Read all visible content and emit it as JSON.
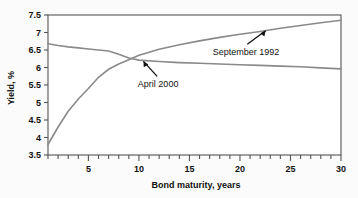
{
  "chart_data": {
    "type": "line",
    "title": "",
    "xlabel": "Bond maturity, years",
    "ylabel": "Yield, %",
    "xlim": [
      1,
      30
    ],
    "ylim": [
      3.5,
      7.5
    ],
    "xticks": [
      5,
      10,
      15,
      20,
      25,
      30
    ],
    "xtick_labels": [
      "5",
      "10",
      "15",
      "20",
      "25",
      "30"
    ],
    "xminor_step": 1,
    "yticks": [
      3.5,
      4,
      4.5,
      5,
      5.5,
      6,
      6.5,
      7,
      7.5
    ],
    "ytick_labels": [
      "3.5",
      "4",
      "4.5",
      "5",
      "5.5",
      "6",
      "6.5",
      "7",
      "7.5"
    ],
    "grid": false,
    "legend": "none",
    "line_color": "#8a8a8a",
    "axis_color": "#555555",
    "background": "#fbfbfb",
    "series": [
      {
        "name": "September 1992",
        "x": [
          1,
          2,
          3,
          4,
          5,
          6,
          7,
          8,
          9,
          10,
          12,
          14,
          16,
          18,
          20,
          22,
          24,
          26,
          28,
          30
        ],
        "values": [
          3.8,
          4.3,
          4.75,
          5.1,
          5.4,
          5.72,
          5.95,
          6.1,
          6.22,
          6.35,
          6.52,
          6.65,
          6.76,
          6.86,
          6.95,
          7.03,
          7.12,
          7.2,
          7.28,
          7.35
        ]
      },
      {
        "name": "April 2000",
        "x": [
          1,
          2,
          3,
          4,
          5,
          6,
          7,
          8,
          9,
          10,
          12,
          14,
          16,
          18,
          20,
          22,
          24,
          26,
          28,
          30
        ],
        "values": [
          6.68,
          6.63,
          6.59,
          6.56,
          6.53,
          6.5,
          6.47,
          6.38,
          6.27,
          6.21,
          6.17,
          6.14,
          6.12,
          6.1,
          6.08,
          6.06,
          6.04,
          6.02,
          5.99,
          5.96
        ]
      }
    ],
    "annotations": [
      {
        "label": "April 2000",
        "target_x": 10.4,
        "target_y": 6.2,
        "text_x": 11.9,
        "text_y": 5.44
      },
      {
        "label": "September 1992",
        "target_x": 22.6,
        "target_y": 7.07,
        "text_x": 20.6,
        "text_y": 6.36
      }
    ]
  }
}
